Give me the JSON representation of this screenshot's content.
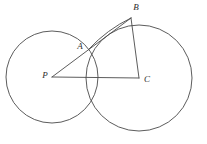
{
  "figure": {
    "background_color": "#ffffff",
    "stroke_color": "#4a4a4a",
    "label_color": "#2b2b2b",
    "width": 207,
    "height": 144
  },
  "labels": {
    "point_a": "A",
    "point_b": "B",
    "point_c": "C",
    "point_p": "P"
  },
  "chart_data": {
    "type": "diagram",
    "circles": [
      {
        "name": "circle-p",
        "center_label": "P",
        "cx": 52,
        "cy": 77,
        "r": 46
      },
      {
        "name": "circle-c",
        "center_label": "C",
        "cx": 139,
        "cy": 78,
        "r": 53
      }
    ],
    "points": [
      {
        "label": "P",
        "x": 52,
        "y": 77,
        "role": "center-of-left-circle",
        "label_x": 45,
        "label_y": 76
      },
      {
        "label": "A",
        "x": 89,
        "y": 49,
        "role": "circle-intersection",
        "label_x": 80,
        "label_y": 47
      },
      {
        "label": "B",
        "x": 131,
        "y": 18,
        "role": "point-on-circle-c",
        "label_x": 136,
        "label_y": 8
      },
      {
        "label": "C",
        "x": 139,
        "y": 78,
        "role": "center-of-right-circle",
        "label_x": 147,
        "label_y": 80
      }
    ],
    "segments": [
      {
        "name": "segment-p-b",
        "from": "P",
        "to": "B",
        "x1": 52,
        "y1": 77,
        "x2": 131,
        "y2": 18,
        "passes_through": "A"
      },
      {
        "name": "segment-a-b-chord",
        "from": "A",
        "to": "B",
        "x1": 89,
        "y1": 49,
        "x2": 131,
        "y2": 18,
        "curved": true
      },
      {
        "name": "segment-p-c",
        "from": "P",
        "to": "C",
        "x1": 52,
        "y1": 77,
        "x2": 139,
        "y2": 78
      },
      {
        "name": "segment-b-c",
        "from": "B",
        "to": "C",
        "x1": 131,
        "y1": 18,
        "x2": 139,
        "y2": 78
      }
    ],
    "xlabel": "",
    "ylabel": "",
    "grid": false,
    "legend": "none"
  }
}
